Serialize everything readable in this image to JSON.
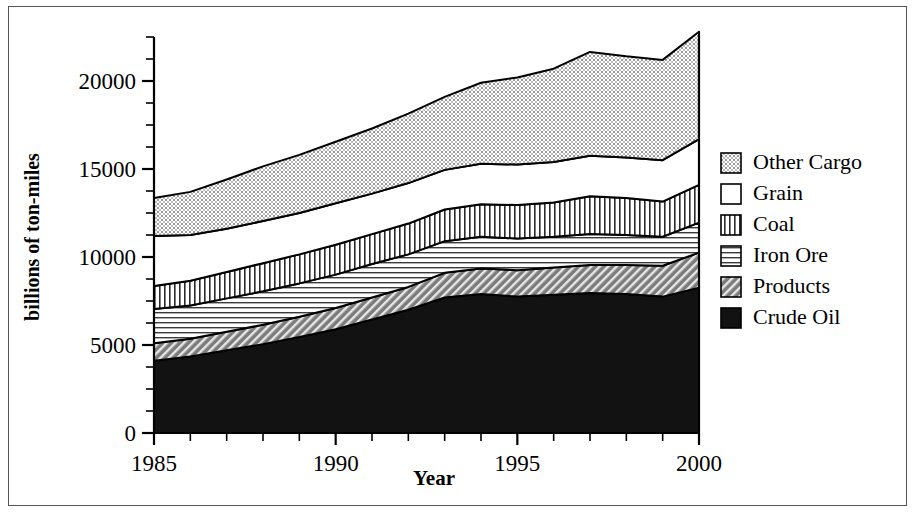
{
  "chart_data": {
    "type": "area",
    "stacked": true,
    "title": "",
    "xlabel": "Year",
    "ylabel": "billions of ton-miles",
    "x": [
      1985,
      1986,
      1987,
      1988,
      1989,
      1990,
      1991,
      1992,
      1993,
      1994,
      1995,
      1996,
      1997,
      1998,
      1999,
      2000
    ],
    "xlim": [
      1985,
      2000
    ],
    "ylim": [
      0,
      22500
    ],
    "xticks": [
      1985,
      1990,
      1995,
      2000
    ],
    "xtick_labels": [
      "1985",
      "1990",
      "1995",
      "2000"
    ],
    "x_minor_tick_step": 1,
    "yticks": [
      0,
      5000,
      10000,
      15000,
      20000
    ],
    "ytick_labels": [
      "0",
      "5000",
      "10000",
      "15000",
      "20000"
    ],
    "y_minor_tick_step": 1250,
    "grid": false,
    "legend_position": "right",
    "series": [
      {
        "name": "Crude Oil",
        "fill": "solid-black",
        "color": "#111111",
        "values": [
          4100,
          4350,
          4700,
          5050,
          5450,
          5900,
          6450,
          7000,
          7700,
          7900,
          7750,
          7850,
          7950,
          7900,
          7750,
          8250
        ]
      },
      {
        "name": "Products",
        "fill": "diagonal-hatch",
        "color": "#6f6f6f",
        "values": [
          1000,
          1000,
          1050,
          1100,
          1150,
          1200,
          1250,
          1300,
          1400,
          1450,
          1500,
          1550,
          1600,
          1650,
          1750,
          2000
        ]
      },
      {
        "name": "Iron Ore",
        "fill": "horizontal-lines",
        "color": "#dcdcdc",
        "values": [
          1950,
          1900,
          1900,
          1900,
          1900,
          1900,
          1900,
          1850,
          1800,
          1800,
          1800,
          1750,
          1750,
          1700,
          1650,
          1700
        ]
      },
      {
        "name": "Coal",
        "fill": "vertical-lines",
        "color": "#cfcfcf",
        "values": [
          1300,
          1400,
          1500,
          1600,
          1650,
          1700,
          1700,
          1750,
          1800,
          1850,
          1900,
          1950,
          2150,
          2100,
          2000,
          2150
        ]
      },
      {
        "name": "Grain",
        "fill": "white",
        "color": "#ffffff",
        "values": [
          2850,
          2600,
          2450,
          2400,
          2350,
          2350,
          2300,
          2300,
          2250,
          2300,
          2300,
          2300,
          2300,
          2300,
          2350,
          2600
        ]
      },
      {
        "name": "Other Cargo",
        "fill": "stipple-dots",
        "color": "#d9d9d9",
        "values": [
          2150,
          2450,
          2800,
          3100,
          3300,
          3500,
          3700,
          3950,
          4150,
          4600,
          4950,
          5300,
          5900,
          5750,
          5700,
          6100
        ]
      }
    ],
    "totals": [
      13350,
      13700,
      14400,
      15150,
      15800,
      16550,
      17300,
      18150,
      19100,
      19900,
      20200,
      20700,
      21650,
      21400,
      21200,
      22800
    ],
    "legend_entries": [
      "Other Cargo",
      "Grain",
      "Coal",
      "Iron Ore",
      "Products",
      "Crude Oil"
    ]
  },
  "legend": {
    "items": [
      {
        "label": "Other Cargo",
        "pattern": "stipple-dots"
      },
      {
        "label": "Grain",
        "pattern": "white"
      },
      {
        "label": "Coal",
        "pattern": "vertical-lines"
      },
      {
        "label": "Iron Ore",
        "pattern": "horizontal-lines"
      },
      {
        "label": "Products",
        "pattern": "diagonal-hatch"
      },
      {
        "label": "Crude Oil",
        "pattern": "solid-black"
      }
    ]
  }
}
